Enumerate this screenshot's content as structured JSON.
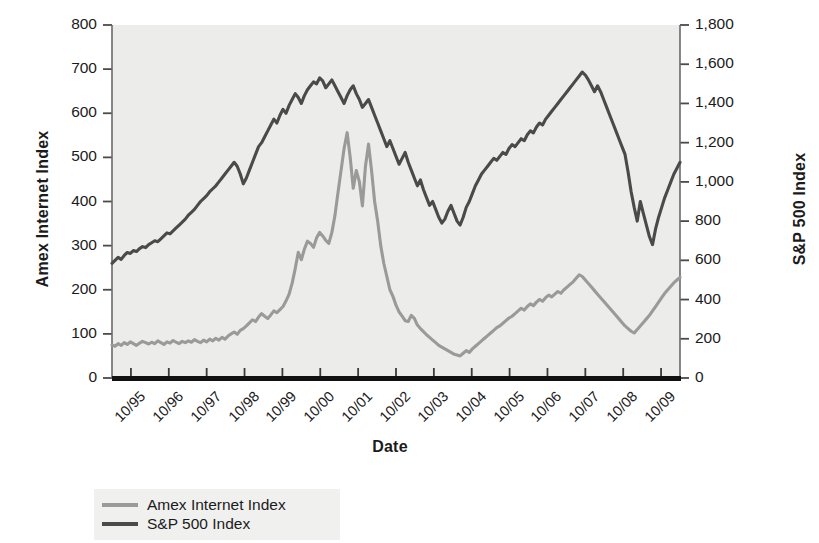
{
  "chart_data": {
    "type": "line",
    "title": "",
    "xlabel": "Date",
    "ylabel_left": "Amex Internet Index",
    "ylabel_right": "S&P 500 Index",
    "grid": false,
    "legend_position": "bottom-left",
    "plot_background": "#ececea",
    "x_tick_labels": [
      "10/95",
      "10/96",
      "10/97",
      "10/98",
      "10/99",
      "10/00",
      "10/01",
      "10/02",
      "10/03",
      "10/04",
      "10/05",
      "10/06",
      "10/07",
      "10/08",
      "10/09"
    ],
    "left_axis": {
      "label": "Amex Internet Index",
      "ticks": [
        "0",
        "100",
        "200",
        "300",
        "400",
        "500",
        "600",
        "700",
        "800"
      ],
      "ylim": [
        0,
        800
      ],
      "color": "#969696"
    },
    "right_axis": {
      "label": "S&P 500 Index",
      "ticks": [
        "0",
        "200",
        "400",
        "600",
        "800",
        "1,000",
        "1,200",
        "1,400",
        "1,600",
        "1,800"
      ],
      "ylim": [
        0,
        1800
      ],
      "color": "#4a4a4a"
    },
    "series": [
      {
        "name": "Amex Internet Index",
        "axis": "left",
        "color": "#9a9a9a",
        "values": [
          75,
          72,
          78,
          74,
          80,
          76,
          82,
          78,
          74,
          79,
          83,
          80,
          77,
          81,
          78,
          84,
          80,
          76,
          82,
          79,
          85,
          81,
          78,
          83,
          80,
          84,
          81,
          87,
          83,
          80,
          86,
          82,
          88,
          84,
          90,
          86,
          92,
          88,
          95,
          100,
          104,
          99,
          108,
          112,
          118,
          125,
          132,
          128,
          138,
          146,
          140,
          135,
          143,
          152,
          148,
          155,
          162,
          175,
          190,
          215,
          248,
          285,
          268,
          292,
          310,
          305,
          296,
          318,
          330,
          322,
          312,
          305,
          330,
          368,
          420,
          470,
          520,
          556,
          500,
          430,
          470,
          445,
          390,
          480,
          530,
          470,
          400,
          355,
          300,
          260,
          230,
          200,
          185,
          165,
          150,
          140,
          130,
          128,
          142,
          135,
          120,
          112,
          105,
          98,
          92,
          86,
          80,
          74,
          70,
          66,
          62,
          58,
          54,
          52,
          50,
          56,
          62,
          58,
          66,
          72,
          78,
          84,
          90,
          96,
          102,
          108,
          114,
          118,
          124,
          130,
          136,
          140,
          146,
          152,
          158,
          154,
          162,
          168,
          164,
          172,
          178,
          174,
          182,
          188,
          184,
          190,
          196,
          192,
          200,
          206,
          212,
          218,
          226,
          234,
          230,
          222,
          214,
          206,
          198,
          190,
          182,
          174,
          166,
          158,
          150,
          142,
          134,
          126,
          118,
          112,
          106,
          102,
          110,
          118,
          126,
          134,
          142,
          152,
          162,
          172,
          182,
          192,
          200,
          208,
          216,
          222,
          228
        ]
      },
      {
        "name": "S&P 500 Index",
        "axis": "right",
        "color": "#4a4a4a",
        "values": [
          585,
          600,
          615,
          605,
          625,
          640,
          635,
          650,
          645,
          660,
          670,
          665,
          680,
          690,
          700,
          695,
          710,
          725,
          740,
          735,
          750,
          765,
          780,
          795,
          810,
          830,
          845,
          860,
          880,
          900,
          915,
          930,
          950,
          965,
          980,
          1000,
          1020,
          1040,
          1060,
          1080,
          1100,
          1080,
          1040,
          990,
          1020,
          1060,
          1100,
          1140,
          1180,
          1200,
          1230,
          1260,
          1290,
          1320,
          1300,
          1340,
          1370,
          1350,
          1390,
          1420,
          1450,
          1430,
          1400,
          1440,
          1470,
          1490,
          1510,
          1500,
          1530,
          1515,
          1480,
          1500,
          1520,
          1490,
          1460,
          1430,
          1400,
          1440,
          1470,
          1490,
          1450,
          1420,
          1380,
          1400,
          1420,
          1380,
          1340,
          1300,
          1260,
          1220,
          1180,
          1210,
          1170,
          1130,
          1090,
          1120,
          1150,
          1100,
          1060,
          1020,
          980,
          1010,
          960,
          920,
          880,
          900,
          860,
          820,
          790,
          810,
          850,
          880,
          840,
          800,
          780,
          820,
          870,
          900,
          940,
          980,
          1010,
          1040,
          1060,
          1080,
          1100,
          1120,
          1110,
          1130,
          1150,
          1140,
          1170,
          1190,
          1180,
          1200,
          1220,
          1210,
          1240,
          1260,
          1250,
          1280,
          1300,
          1290,
          1320,
          1340,
          1360,
          1380,
          1400,
          1420,
          1440,
          1460,
          1480,
          1500,
          1520,
          1540,
          1560,
          1545,
          1520,
          1490,
          1460,
          1490,
          1460,
          1420,
          1380,
          1340,
          1300,
          1260,
          1220,
          1180,
          1140,
          1050,
          950,
          870,
          800,
          900,
          840,
          780,
          720,
          680,
          760,
          820,
          870,
          920,
          960,
          1000,
          1040,
          1070,
          1100
        ]
      }
    ],
    "annotations": []
  }
}
